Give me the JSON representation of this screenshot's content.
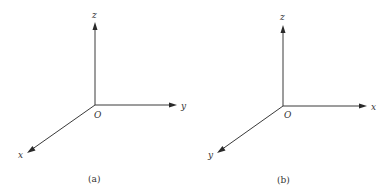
{
  "panels": [
    {
      "id": "a",
      "caption": "(a)",
      "origin_label": "O",
      "axes": {
        "vertical": "z",
        "horizontal": "y",
        "diagonal": "x"
      }
    },
    {
      "id": "b",
      "caption": "(b)",
      "origin_label": "O",
      "axes": {
        "vertical": "z",
        "horizontal": "x",
        "diagonal": "y"
      }
    }
  ],
  "colors": {
    "line": "#3a3a3a",
    "text": "#333333",
    "background": "#ffffff"
  }
}
